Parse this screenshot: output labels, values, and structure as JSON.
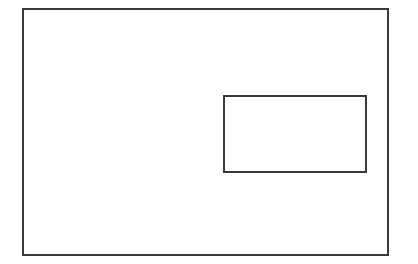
{
  "diagram": {
    "canvas": {
      "width": 418,
      "height": 264,
      "background": "#ffffff"
    },
    "shapes": [
      {
        "id": "outer",
        "type": "rectangle",
        "x": 22,
        "y": 8,
        "width": 367,
        "height": 248,
        "stroke": "#3a3a3a",
        "stroke_width": 2,
        "fill": "none"
      },
      {
        "id": "inner",
        "type": "rectangle",
        "x": 223,
        "y": 95,
        "width": 144,
        "height": 78,
        "stroke": "#3a3a3a",
        "stroke_width": 2,
        "fill": "none"
      }
    ]
  }
}
